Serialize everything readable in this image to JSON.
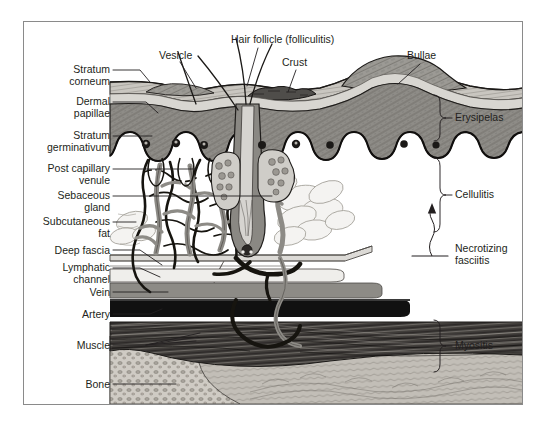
{
  "figure": {
    "kind": "medical-cross-section-diagram",
    "frame": {
      "x": 23,
      "y": 21,
      "width": 500,
      "height": 384,
      "border_color": "#8a8a8a"
    }
  },
  "colors": {
    "background": "#ffffff",
    "ink": "#231f20",
    "leader_line": "#231f20",
    "stratum_corneum": "#c9c6c0",
    "epidermis": "#9c9a95",
    "dermis": "#8e8c87",
    "dermal_papillae_band": "#d8d6d1",
    "subcutaneous_fat": "#e8e7e4",
    "deep_fascia": "#dcdad6",
    "lymphatic": "#efeeeb",
    "vein": "#8d8b86",
    "artery": "#111111",
    "muscle": "#4a4745",
    "bone_cortex": "#b9b5ae",
    "bone_marrow": "#cfcbc4",
    "vessel_gray": "#8d8b86",
    "vessel_dark": "#1a1a1a",
    "gland": "#bfbdb7",
    "crust": "#4f4d4a",
    "bullae": "#9c9a95"
  },
  "labels_left": [
    {
      "id": "stratum-corneum",
      "lines": [
        "Stratum",
        "corneum"
      ],
      "x": 28,
      "y": 64,
      "w": 82,
      "leader": {
        "x1": 113,
        "y1": 70,
        "x2": 148,
        "y2": 82,
        "elbow": true
      }
    },
    {
      "id": "dermal-papillae",
      "lines": [
        "Dermal",
        "papillae"
      ],
      "x": 28,
      "y": 96,
      "w": 82,
      "leader": {
        "x1": 113,
        "y1": 102,
        "x2": 157,
        "y2": 113,
        "elbow": true
      }
    },
    {
      "id": "stratum-germinativum",
      "lines": [
        "Stratum",
        "germinativum"
      ],
      "x": 18,
      "y": 130,
      "w": 92,
      "leader": {
        "x1": 113,
        "y1": 136,
        "x2": 152,
        "y2": 136,
        "elbow": false
      }
    },
    {
      "id": "post-capillary-venule",
      "lines": [
        "Post capillary",
        "venule"
      ],
      "x": 20,
      "y": 163,
      "w": 90,
      "leader": {
        "x1": 113,
        "y1": 169,
        "x2": 190,
        "y2": 169,
        "elbow": false
      }
    },
    {
      "id": "sebaceous-gland",
      "lines": [
        "Sebaceous",
        "gland"
      ],
      "x": 28,
      "y": 190,
      "w": 82,
      "leader": {
        "x1": 113,
        "y1": 196,
        "x2": 268,
        "y2": 196,
        "elbow": false
      }
    },
    {
      "id": "subcutaneous-fat",
      "lines": [
        "Subcutaneous",
        "fat"
      ],
      "x": 18,
      "y": 216,
      "w": 92,
      "leader": {
        "x1": 113,
        "y1": 222,
        "x2": 137,
        "y2": 222,
        "elbow": false
      }
    },
    {
      "id": "deep-fascia",
      "lines": [
        "Deep fascia"
      ],
      "x": 28,
      "y": 246,
      "w": 82,
      "leader": {
        "x1": 113,
        "y1": 250,
        "x2": 160,
        "y2": 264,
        "elbow": true
      }
    },
    {
      "id": "lymphatic-channel",
      "lines": [
        "Lymphatic",
        "channel"
      ],
      "x": 28,
      "y": 262,
      "w": 82,
      "leader": {
        "x1": 113,
        "y1": 268,
        "x2": 158,
        "y2": 277,
        "elbow": true
      }
    },
    {
      "id": "vein",
      "lines": [
        "Vein"
      ],
      "x": 28,
      "y": 288,
      "w": 82,
      "leader": {
        "x1": 113,
        "y1": 292,
        "x2": 165,
        "y2": 292,
        "elbow": false
      }
    },
    {
      "id": "artery",
      "lines": [
        "Artery"
      ],
      "x": 28,
      "y": 310,
      "w": 82,
      "leader": {
        "x1": 113,
        "y1": 314,
        "x2": 160,
        "y2": 310,
        "elbow": false
      }
    },
    {
      "id": "muscle",
      "lines": [
        "Muscle"
      ],
      "x": 28,
      "y": 341,
      "w": 82,
      "leader": {
        "x1": 113,
        "y1": 345,
        "x2": 175,
        "y2": 338,
        "elbow": false
      }
    },
    {
      "id": "bone",
      "lines": [
        "Bone"
      ],
      "x": 28,
      "y": 380,
      "w": 82,
      "leader": {
        "x1": 113,
        "y1": 384,
        "x2": 175,
        "y2": 384,
        "elbow": false
      }
    }
  ],
  "labels_top": [
    {
      "id": "vesicle",
      "text": "Vesicle",
      "x": 160,
      "y": 51,
      "leader": {
        "x1": 182,
        "y1": 64,
        "x2": 197,
        "y2": 88
      }
    },
    {
      "id": "hair-follicle",
      "text": "Hair follicle (folliculitis)",
      "x": 232,
      "y": 35,
      "leader": {
        "x1": 258,
        "y1": 48,
        "x2": 246,
        "y2": 86
      }
    },
    {
      "id": "crust",
      "text": "Crust",
      "x": 283,
      "y": 58,
      "leader": {
        "x1": 295,
        "y1": 70,
        "x2": 288,
        "y2": 90
      }
    },
    {
      "id": "bullae",
      "text": "Bullae",
      "x": 408,
      "y": 51,
      "leader": {
        "x1": 418,
        "y1": 64,
        "x2": 396,
        "y2": 85
      }
    }
  ],
  "labels_right": [
    {
      "id": "erysipelas",
      "lines": [
        "Erysipelas"
      ],
      "x": 455,
      "y": 112,
      "bracket": {
        "x": 440,
        "y1": 95,
        "y2": 140
      }
    },
    {
      "id": "cellulitis",
      "lines": [
        "Cellulitis"
      ],
      "x": 455,
      "y": 190,
      "bracket": {
        "x": 440,
        "y1": 158,
        "y2": 248
      }
    },
    {
      "id": "necrotizing-fasciitis",
      "lines": [
        "Necrotizing",
        "fasciitis"
      ],
      "x": 455,
      "y": 246,
      "bracket": null
    },
    {
      "id": "myositis",
      "lines": [
        "Myositis"
      ],
      "x": 455,
      "y": 340,
      "bracket": {
        "x": 440,
        "y1": 320,
        "y2": 372
      }
    }
  ],
  "annotations": {
    "cellulitis_arrow": {
      "description": "upward arrow with wavy tail rising from necrotizing fasciitis level to cellulitis level",
      "x": 432,
      "y_top": 205,
      "y_bottom": 256
    },
    "necrotizing_rule": {
      "description": "short horizontal rule under necrotizing fasciitis bracket",
      "x1": 415,
      "y1": 255,
      "x2": 448,
      "y2": 255
    }
  }
}
